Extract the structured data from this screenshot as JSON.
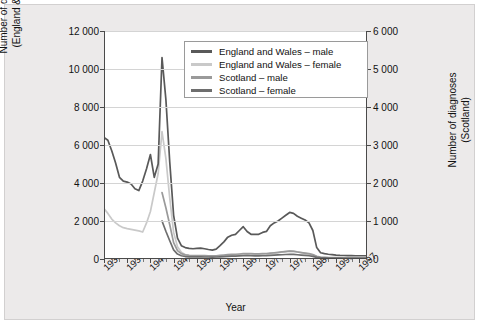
{
  "axes": {
    "left": {
      "title_line1": "Number of diagnoses",
      "title_line2": "(England & Wales)",
      "ticks": [
        "12 000",
        "10 000",
        "8 000",
        "6 000",
        "4 000",
        "2 000",
        "0"
      ]
    },
    "right": {
      "title_line1": "Number of diagnoses",
      "title_line2": "(Scotland)",
      "ticks": [
        "6 000",
        "5 000",
        "4 000",
        "3 000",
        "2 000",
        "1 000",
        "0"
      ]
    },
    "x": {
      "title": "Year",
      "ticks": [
        "1931",
        "1937",
        "1943",
        "1949",
        "1955",
        "1961",
        "1967",
        "1973",
        "1979",
        "1985",
        "1991",
        "1997"
      ]
    }
  },
  "legend": {
    "items": [
      {
        "label": "England and Wales – male",
        "color": "#595959"
      },
      {
        "label": "England and Wales – female",
        "color": "#c9c9c9"
      },
      {
        "label": "Scotland – male",
        "color": "#9a9a9a"
      },
      {
        "label": "Scotland – female",
        "color": "#6e6e6e"
      }
    ]
  },
  "chart_data": {
    "type": "line",
    "title": "",
    "xlabel": "Year",
    "ylabel": "Number of diagnoses (England & Wales)",
    "ylabel_secondary": "Number of diagnoses (Scotland)",
    "xlim": [
      1931,
      1999
    ],
    "ylim": [
      0,
      12000
    ],
    "ylim_secondary": [
      0,
      6000
    ],
    "grid": "horizontal",
    "legend_position": "top-center",
    "x": [
      1931,
      1932,
      1933,
      1934,
      1935,
      1936,
      1937,
      1938,
      1939,
      1940,
      1941,
      1942,
      1943,
      1944,
      1945,
      1946,
      1947,
      1948,
      1949,
      1950,
      1951,
      1952,
      1953,
      1954,
      1955,
      1956,
      1957,
      1958,
      1959,
      1960,
      1961,
      1962,
      1963,
      1964,
      1965,
      1966,
      1967,
      1968,
      1969,
      1970,
      1971,
      1972,
      1973,
      1974,
      1975,
      1976,
      1977,
      1978,
      1979,
      1980,
      1981,
      1982,
      1983,
      1984,
      1985,
      1986,
      1987,
      1988,
      1989,
      1990,
      1991,
      1992,
      1993,
      1994,
      1995,
      1996,
      1997,
      1998,
      1999
    ],
    "series": [
      {
        "name": "England and Wales – male",
        "axis": "left",
        "color": "#595959",
        "values": [
          6400,
          6250,
          5700,
          5050,
          4300,
          4100,
          4050,
          3950,
          3700,
          3600,
          4100,
          4750,
          5500,
          4300,
          5000,
          10600,
          8400,
          5100,
          2300,
          1100,
          700,
          600,
          560,
          540,
          560,
          570,
          540,
          500,
          470,
          520,
          700,
          900,
          1150,
          1250,
          1300,
          1500,
          1700,
          1450,
          1300,
          1300,
          1300,
          1400,
          1450,
          1750,
          1900,
          2000,
          2150,
          2300,
          2450,
          2400,
          2250,
          2150,
          2050,
          1900,
          1500,
          600,
          330,
          280,
          250,
          230,
          200,
          190,
          185,
          180,
          175,
          170,
          170,
          170,
          170
        ]
      },
      {
        "name": "England and Wales – female",
        "axis": "left",
        "color": "#c9c9c9",
        "values": [
          2650,
          2400,
          2100,
          1900,
          1750,
          1650,
          1600,
          1560,
          1520,
          1480,
          1420,
          1900,
          2500,
          3500,
          4500,
          6700,
          5300,
          3200,
          1400,
          650,
          350,
          230,
          180,
          150,
          140,
          140,
          135,
          130,
          125,
          130,
          150,
          170,
          190,
          200,
          210,
          230,
          250,
          260,
          250,
          240,
          240,
          250,
          260,
          280,
          300,
          330,
          360,
          400,
          430,
          420,
          380,
          340,
          300,
          260,
          210,
          130,
          90,
          80,
          70,
          65,
          60,
          58,
          55,
          55,
          52,
          50,
          50,
          50,
          50
        ]
      },
      {
        "name": "Scotland – male",
        "axis": "right",
        "color": "#9a9a9a",
        "values": [
          null,
          null,
          null,
          null,
          null,
          null,
          null,
          null,
          null,
          null,
          null,
          null,
          null,
          null,
          null,
          1750,
          1350,
          900,
          430,
          220,
          140,
          110,
          95,
          90,
          90,
          90,
          88,
          85,
          82,
          85,
          95,
          105,
          115,
          120,
          125,
          132,
          140,
          145,
          140,
          135,
          135,
          140,
          145,
          155,
          165,
          175,
          185,
          195,
          205,
          200,
          185,
          170,
          155,
          140,
          115,
          70,
          50,
          45,
          40,
          38,
          35,
          33,
          32,
          31,
          30,
          29,
          29,
          29,
          29
        ]
      },
      {
        "name": "Scotland – female",
        "axis": "right",
        "color": "#6e6e6e",
        "values": [
          null,
          null,
          null,
          null,
          null,
          null,
          null,
          null,
          null,
          null,
          null,
          null,
          null,
          null,
          null,
          1000,
          730,
          480,
          240,
          130,
          85,
          65,
          58,
          55,
          55,
          55,
          53,
          52,
          50,
          52,
          58,
          64,
          70,
          74,
          77,
          81,
          85,
          88,
          85,
          82,
          82,
          85,
          88,
          94,
          100,
          106,
          112,
          118,
          124,
          121,
          112,
          103,
          94,
          85,
          70,
          43,
          31,
          28,
          25,
          23,
          22,
          21,
          20,
          19,
          18,
          18,
          18,
          18,
          18
        ]
      }
    ]
  }
}
